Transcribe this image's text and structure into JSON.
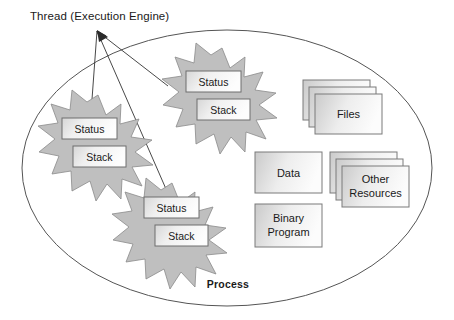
{
  "diagram": {
    "title": "Thread (Execution Engine)",
    "container_label": "Process",
    "colors": {
      "starburst_fill": "#bfbfbf",
      "starburst_stroke": "#8a8a8a",
      "box_stroke": "#8a8a8a",
      "box_fill_light": "#f2f2f2",
      "box_fill_dark": "#c9c9c9",
      "outline": "#555555",
      "text": "#1a1a1a",
      "background": "#ffffff"
    },
    "threads": [
      {
        "id": "thread-left",
        "status_label": "Status",
        "stack_label": "Stack"
      },
      {
        "id": "thread-top",
        "status_label": "Status",
        "stack_label": "Stack"
      },
      {
        "id": "thread-bottom",
        "status_label": "Status",
        "stack_label": "Stack"
      }
    ],
    "resources": [
      {
        "id": "files",
        "label": "Files",
        "stacked": true,
        "lines": [
          "Files"
        ]
      },
      {
        "id": "data",
        "label": "Data",
        "stacked": false,
        "lines": [
          "Data"
        ]
      },
      {
        "id": "binary-program",
        "label": "Binary Program",
        "stacked": false,
        "lines": [
          "Binary",
          "Program"
        ]
      },
      {
        "id": "other-resources",
        "label": "Other Resources",
        "stacked": true,
        "lines": [
          "Other",
          "Resources"
        ]
      }
    ],
    "leader_lines": 3
  }
}
